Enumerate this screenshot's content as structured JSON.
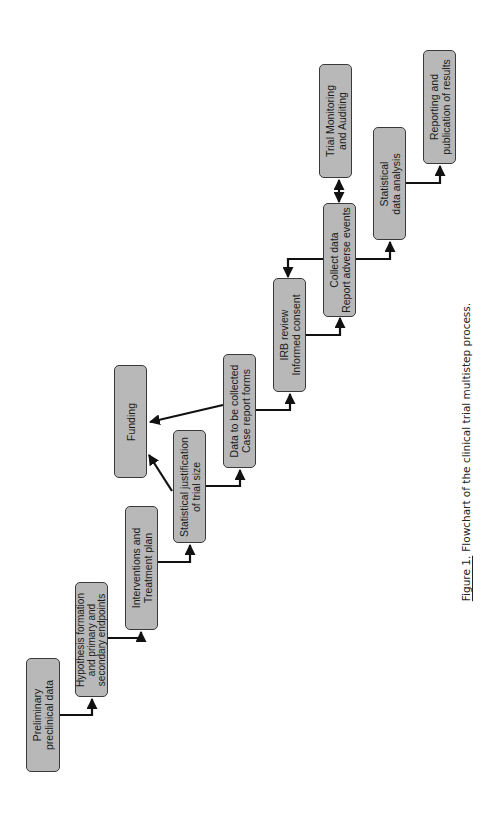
{
  "diagram": {
    "type": "flowchart",
    "orientation": "rotated-90-ccw",
    "box_fill": "#b8b8b8",
    "box_border": "#3a3a3a",
    "nodes": [
      {
        "id": "preliminary",
        "lines": [
          "Preliminary",
          "preclinical data"
        ]
      },
      {
        "id": "hypothesis",
        "lines": [
          "Hypothesis formation",
          "and primary and",
          "secondary endpoints"
        ]
      },
      {
        "id": "interventions",
        "lines": [
          "Interventions and",
          "Treatment plan"
        ]
      },
      {
        "id": "stat_justification",
        "lines": [
          "Statistical justification",
          "of trial size"
        ]
      },
      {
        "id": "funding",
        "lines": [
          "Funding"
        ]
      },
      {
        "id": "data_collected",
        "lines": [
          "Data to be collected",
          "Case report forms"
        ]
      },
      {
        "id": "irb",
        "lines": [
          "IRB review",
          "Informed consent"
        ]
      },
      {
        "id": "collect_data",
        "lines": [
          "Collect data",
          "Report adverse events"
        ]
      },
      {
        "id": "trial_monitoring",
        "lines": [
          "Trial Monitoring",
          "and Auditing"
        ]
      },
      {
        "id": "stat_analysis",
        "lines": [
          "Statistical",
          "data analysis"
        ]
      },
      {
        "id": "reporting",
        "lines": [
          "Reporting and",
          "publication of results"
        ]
      }
    ],
    "edges": [
      {
        "from": "preliminary",
        "to": "hypothesis"
      },
      {
        "from": "hypothesis",
        "to": "interventions"
      },
      {
        "from": "interventions",
        "to": "stat_justification"
      },
      {
        "from": "stat_justification",
        "to": "funding"
      },
      {
        "from": "stat_justification",
        "to": "data_collected"
      },
      {
        "from": "data_collected",
        "to": "funding"
      },
      {
        "from": "data_collected",
        "to": "irb"
      },
      {
        "from": "irb",
        "to": "collect_data"
      },
      {
        "from": "collect_data",
        "to": "irb"
      },
      {
        "from": "collect_data",
        "to": "trial_monitoring",
        "bidirectional": true
      },
      {
        "from": "collect_data",
        "to": "stat_analysis"
      },
      {
        "from": "stat_analysis",
        "to": "reporting"
      }
    ]
  },
  "caption": {
    "figure_number": "Figure 1.",
    "text": "Flowchart of the clinical trial multistep process."
  }
}
